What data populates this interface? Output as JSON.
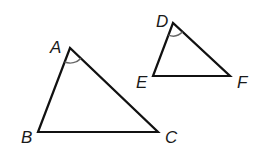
{
  "diagram": {
    "triangles": [
      {
        "name": "ABC",
        "vertices": {
          "A": {
            "label": "A",
            "x": 70,
            "y": 48,
            "lx": 50,
            "ly": 53
          },
          "B": {
            "label": "B",
            "x": 38,
            "y": 132,
            "lx": 21,
            "ly": 143
          },
          "C": {
            "label": "C",
            "x": 158,
            "y": 132,
            "lx": 165,
            "ly": 143
          }
        },
        "angle_mark": {
          "at": "A",
          "radius": 15
        }
      },
      {
        "name": "DEF",
        "vertices": {
          "D": {
            "label": "D",
            "x": 173,
            "y": 23,
            "lx": 156,
            "ly": 27
          },
          "E": {
            "label": "E",
            "x": 153,
            "y": 76,
            "lx": 136,
            "ly": 88
          },
          "F": {
            "label": "F",
            "x": 230,
            "y": 76,
            "lx": 237,
            "ly": 88
          }
        },
        "angle_mark": {
          "at": "D",
          "radius": 13
        }
      }
    ],
    "colors": {
      "stroke": "#111111",
      "arc": "#666666"
    }
  }
}
